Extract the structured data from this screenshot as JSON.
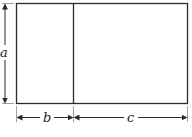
{
  "diagram": {
    "labels": {
      "height": "a",
      "left_width": "b",
      "right_width": "c"
    },
    "colors": {
      "stroke": "#2a2a2a",
      "background": "#ffffff"
    }
  }
}
